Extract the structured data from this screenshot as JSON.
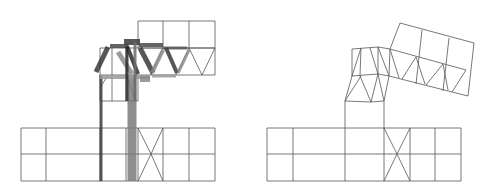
{
  "figure": {
    "width": 495,
    "height": 195,
    "background": "#ffffff",
    "line_color": "#555555",
    "panels": [
      {
        "id": "left",
        "description": "Undeformed truss/mesh with member-force thickness overlay",
        "thin_lines": [
          [
            21,
            128,
            215,
            128
          ],
          [
            21,
            154,
            215,
            154
          ],
          [
            21,
            181,
            215,
            181
          ],
          [
            21,
            128,
            21,
            181
          ],
          [
            46,
            128,
            46,
            181
          ],
          [
            100,
            128,
            100,
            181
          ],
          [
            126,
            128,
            126,
            181
          ],
          [
            138,
            128,
            138,
            181
          ],
          [
            163,
            128,
            163,
            181
          ],
          [
            189,
            128,
            189,
            181
          ],
          [
            215,
            128,
            215,
            181
          ],
          [
            138,
            128,
            151,
            154
          ],
          [
            151,
            154,
            163,
            128
          ],
          [
            138,
            181,
            151,
            154
          ],
          [
            151,
            154,
            163,
            181
          ],
          [
            138,
            21,
            215,
            21
          ],
          [
            138,
            48,
            215,
            48
          ],
          [
            138,
            21,
            138,
            48
          ],
          [
            163,
            21,
            163,
            48
          ],
          [
            189,
            21,
            189,
            48
          ],
          [
            215,
            21,
            215,
            48
          ],
          [
            100,
            48,
            215,
            48
          ],
          [
            100,
            75,
            215,
            75
          ],
          [
            100,
            48,
            100,
            101
          ],
          [
            215,
            48,
            215,
            75
          ],
          [
            100,
            101,
            138,
            101
          ],
          [
            112,
            48,
            112,
            101
          ],
          [
            126,
            48,
            126,
            101
          ],
          [
            138,
            75,
            138,
            101
          ],
          [
            163,
            48,
            151,
            75
          ],
          [
            189,
            48,
            176,
            75
          ],
          [
            189,
            48,
            202,
            75
          ],
          [
            215,
            48,
            202,
            75
          ],
          [
            100,
            88,
            108,
            75
          ],
          [
            126,
            75,
            136,
            101
          ]
        ],
        "thick_members": [
          {
            "x1": 101,
            "y1": 75,
            "x2": 101,
            "y2": 181,
            "w": 3,
            "color": "#3a3a3a"
          },
          {
            "x1": 132,
            "y1": 75,
            "x2": 132,
            "y2": 181,
            "w": 9,
            "color": "#7a7a7a"
          },
          {
            "x1": 96,
            "y1": 72,
            "x2": 108,
            "y2": 47,
            "w": 5,
            "color": "#3a3a3a"
          },
          {
            "x1": 110,
            "y1": 46,
            "x2": 128,
            "y2": 46,
            "w": 4,
            "color": "#4a4a4a"
          },
          {
            "x1": 124,
            "y1": 42,
            "x2": 140,
            "y2": 42,
            "w": 6,
            "color": "#3a3a3a"
          },
          {
            "x1": 139,
            "y1": 45,
            "x2": 163,
            "y2": 45,
            "w": 4,
            "color": "#4a4a4a"
          },
          {
            "x1": 163,
            "y1": 48,
            "x2": 187,
            "y2": 48,
            "w": 3,
            "color": "#5a5a5a"
          },
          {
            "x1": 118,
            "y1": 52,
            "x2": 132,
            "y2": 74,
            "w": 5,
            "color": "#8a8a8a"
          },
          {
            "x1": 127,
            "y1": 46,
            "x2": 138,
            "y2": 74,
            "w": 4,
            "color": "#2a2a2a"
          },
          {
            "x1": 140,
            "y1": 48,
            "x2": 153,
            "y2": 73,
            "w": 5,
            "color": "#3a3a3a"
          },
          {
            "x1": 152,
            "y1": 73,
            "x2": 163,
            "y2": 50,
            "w": 4,
            "color": "#8a8a8a"
          },
          {
            "x1": 166,
            "y1": 48,
            "x2": 177,
            "y2": 73,
            "w": 4,
            "color": "#3a3a3a"
          },
          {
            "x1": 178,
            "y1": 73,
            "x2": 189,
            "y2": 50,
            "w": 3,
            "color": "#8a8a8a"
          },
          {
            "x1": 100,
            "y1": 77,
            "x2": 150,
            "y2": 77,
            "w": 4,
            "color": "#9a9a9a"
          },
          {
            "x1": 140,
            "y1": 79,
            "x2": 150,
            "y2": 79,
            "w": 6,
            "color": "#8a8a8a"
          },
          {
            "x1": 152,
            "y1": 76,
            "x2": 176,
            "y2": 76,
            "w": 3,
            "color": "#9a9a9a"
          },
          {
            "x1": 127,
            "y1": 46,
            "x2": 127,
            "y2": 101,
            "w": 3,
            "color": "#2a2a2a"
          },
          {
            "x1": 135,
            "y1": 42,
            "x2": 135,
            "y2": 101,
            "w": 3,
            "color": "#6a6a6a"
          }
        ]
      },
      {
        "id": "right",
        "description": "Deformed mesh (displacement result)",
        "thin_lines": [
          [
            267,
            128,
            461,
            128
          ],
          [
            267,
            154,
            461,
            154
          ],
          [
            267,
            181,
            461,
            181
          ],
          [
            267,
            128,
            267,
            181
          ],
          [
            293,
            128,
            293,
            181
          ],
          [
            345,
            128,
            345,
            181
          ],
          [
            384,
            128,
            384,
            181
          ],
          [
            410,
            128,
            410,
            181
          ],
          [
            435,
            128,
            435,
            181
          ],
          [
            461,
            128,
            461,
            181
          ],
          [
            384,
            128,
            397,
            154
          ],
          [
            397,
            154,
            410,
            128
          ],
          [
            384,
            181,
            397,
            154
          ],
          [
            397,
            154,
            410,
            181
          ],
          [
            345,
            128,
            345,
            101
          ],
          [
            384,
            128,
            384,
            101
          ],
          [
            345,
            101,
            371,
            102
          ],
          [
            371,
            102,
            384,
            101
          ],
          [
            345,
            101,
            352,
            76
          ],
          [
            352,
            76,
            378,
            74
          ],
          [
            378,
            74,
            389,
            76
          ],
          [
            384,
            101,
            389,
            76
          ],
          [
            352,
            76,
            352,
            49
          ],
          [
            352,
            49,
            378,
            47
          ],
          [
            378,
            47,
            390,
            49
          ],
          [
            389,
            76,
            390,
            49
          ],
          [
            361,
            48,
            360,
            76
          ],
          [
            378,
            47,
            378,
            74
          ],
          [
            361,
            48,
            352,
            76
          ],
          [
            370,
            48,
            378,
            74
          ],
          [
            378,
            47,
            389,
            76
          ],
          [
            345,
            101,
            361,
            76
          ],
          [
            360,
            76,
            371,
            102
          ],
          [
            378,
            74,
            384,
            101
          ],
          [
            371,
            102,
            378,
            74
          ],
          [
            390,
            49,
            400,
            23
          ],
          [
            400,
            23,
            474,
            43
          ],
          [
            474,
            43,
            468,
            96
          ],
          [
            468,
            96,
            389,
            76
          ],
          [
            390,
            49,
            466,
            70
          ],
          [
            422,
            30,
            416,
            84
          ],
          [
            449,
            38,
            443,
            91
          ],
          [
            390,
            49,
            399,
            78
          ],
          [
            416,
            57,
            402,
            79
          ],
          [
            416,
            57,
            425,
            84
          ],
          [
            443,
            64,
            426,
            85
          ],
          [
            443,
            64,
            448,
            90
          ],
          [
            466,
            70,
            452,
            92
          ]
        ]
      }
    ]
  }
}
